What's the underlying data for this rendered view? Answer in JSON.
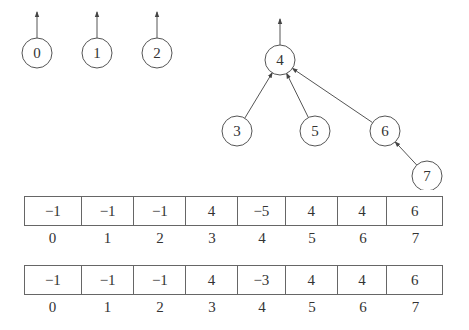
{
  "figure": {
    "forest": {
      "nodes": [
        {
          "id": "0",
          "label": "0",
          "cx": 37,
          "cy": 53,
          "parent": null
        },
        {
          "id": "1",
          "label": "1",
          "cx": 97,
          "cy": 53,
          "parent": null
        },
        {
          "id": "2",
          "label": "2",
          "cx": 157,
          "cy": 53,
          "parent": null
        },
        {
          "id": "4",
          "label": "4",
          "cx": 280,
          "cy": 60,
          "parent": null
        },
        {
          "id": "3",
          "label": "3",
          "cx": 237,
          "cy": 131,
          "parent": "4"
        },
        {
          "id": "5",
          "label": "5",
          "cx": 315,
          "cy": 131,
          "parent": "4"
        },
        {
          "id": "6",
          "label": "6",
          "cx": 385,
          "cy": 131,
          "parent": "4"
        },
        {
          "id": "7",
          "label": "7",
          "cx": 427,
          "cy": 176,
          "parent": "6"
        }
      ],
      "radius": 15
    },
    "arrays": [
      {
        "name": "parent-array-before",
        "values": [
          "−1",
          "−1",
          "−1",
          "4",
          "−5",
          "4",
          "4",
          "6"
        ],
        "indices": [
          "0",
          "1",
          "2",
          "3",
          "4",
          "5",
          "6",
          "7"
        ]
      },
      {
        "name": "parent-array-after",
        "values": [
          "−1",
          "−1",
          "−1",
          "4",
          "−3",
          "4",
          "4",
          "6"
        ],
        "indices": [
          "0",
          "1",
          "2",
          "3",
          "4",
          "5",
          "6",
          "7"
        ]
      }
    ]
  }
}
